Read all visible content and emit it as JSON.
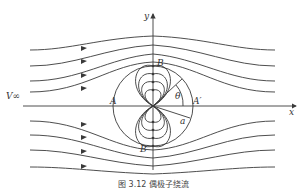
{
  "figure": {
    "caption": "图 3.12  偶极子绕流",
    "labels": {
      "v_inf": "V∞",
      "x_axis": "x",
      "y_axis": "y",
      "point_A": "A",
      "point_A_prime": "A′",
      "point_B": "B",
      "point_B_prime": "B′",
      "theta": "θ",
      "radius": "a"
    },
    "colors": {
      "line": "#3a3a3a",
      "background": "#ffffff"
    }
  }
}
